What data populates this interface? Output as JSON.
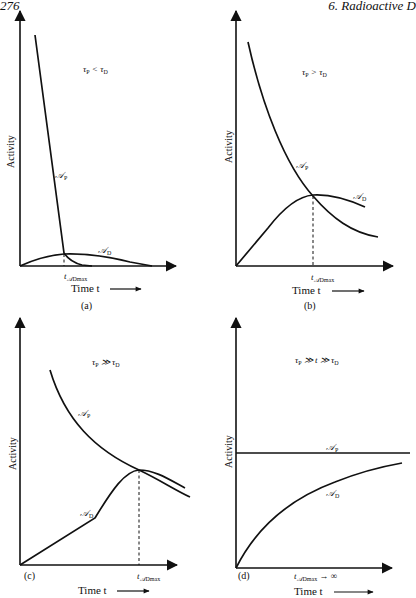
{
  "page": {
    "page_number": "276",
    "chapter_header": "6. Radioactive D"
  },
  "panels": [
    {
      "id": "a",
      "panel_label": "(a)",
      "condition": "τP < τD",
      "condition_parts": {
        "left": "τ",
        "left_sub": "P",
        "op": " < ",
        "right": "τ",
        "right_sub": "D"
      },
      "y_axis_label": "Activity",
      "x_axis_label": "Time t",
      "parent_curve_label": "𝒜",
      "parent_sub": "P",
      "daughter_curve_label": "𝒜",
      "daughter_sub": "D",
      "tmax_label": "t",
      "tmax_sub": "𝒜Dmax"
    },
    {
      "id": "b",
      "panel_label": "(b)",
      "condition": "τP > τD",
      "condition_parts": {
        "left": "τ",
        "left_sub": "P",
        "op": " > ",
        "right": "τ",
        "right_sub": "D"
      },
      "y_axis_label": "Activity",
      "x_axis_label": "Time t",
      "parent_curve_label": "𝒜",
      "parent_sub": "P",
      "daughter_curve_label": "𝒜",
      "daughter_sub": "D",
      "tmax_label": "t",
      "tmax_sub": "𝒜Dmax"
    },
    {
      "id": "c",
      "panel_label": "(c)",
      "condition": "τP ≫ τD",
      "condition_parts": {
        "left": "τ",
        "left_sub": "P",
        "op": " ≫ ",
        "right": "τ",
        "right_sub": "D"
      },
      "y_axis_label": "Activity",
      "x_axis_label": "Time t",
      "parent_curve_label": "𝒜",
      "parent_sub": "P",
      "daughter_curve_label": "𝒜",
      "daughter_sub": "D",
      "tmax_label": "t",
      "tmax_sub": "𝒜Dmax"
    },
    {
      "id": "d",
      "panel_label": "(d)",
      "condition": "τP ≫ t ≫ τD",
      "condition_parts": {
        "left": "τ",
        "left_sub": "P",
        "op": " ≫ t ≫ ",
        "right": "τ",
        "right_sub": "D"
      },
      "y_axis_label": "Activity",
      "x_axis_label": "Time t",
      "parent_curve_label": "𝒜",
      "parent_sub": "P",
      "daughter_curve_label": "𝒜",
      "daughter_sub": "D",
      "tmax_label": "t",
      "tmax_sub": "𝒜Dmax",
      "tmax_suffix": " → ∞"
    }
  ],
  "colors": {
    "ink": "#111111",
    "background": "#ffffff"
  }
}
